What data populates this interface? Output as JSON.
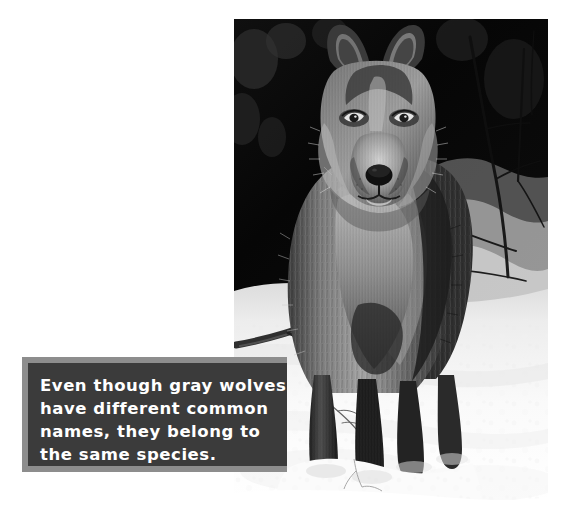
{
  "page": {
    "background_color": "#ffffff",
    "width": 582,
    "height": 519
  },
  "photo": {
    "name": "gray-wolf-photograph",
    "description": "Black and white photograph of a gray wolf standing in deep snow, facing the camera, with a dark forest background and bare branches",
    "palette": {
      "snow": "#fbfbfb",
      "forest_dark": "#0b0b0b",
      "fur_mid": "#6e6e6e",
      "fur_light": "#c9c9c9",
      "fur_dark": "#2a2a2a"
    }
  },
  "caption": {
    "background_color": "#3b3b3b",
    "shadow_color": "#8d8d8d",
    "text_color": "#ffffff",
    "lines": [
      "Even though gray wolves",
      "have different common",
      "names, they belong to",
      "the same species."
    ],
    "full_text": "Even though gray wolves have different common names, they belong to the same species."
  }
}
